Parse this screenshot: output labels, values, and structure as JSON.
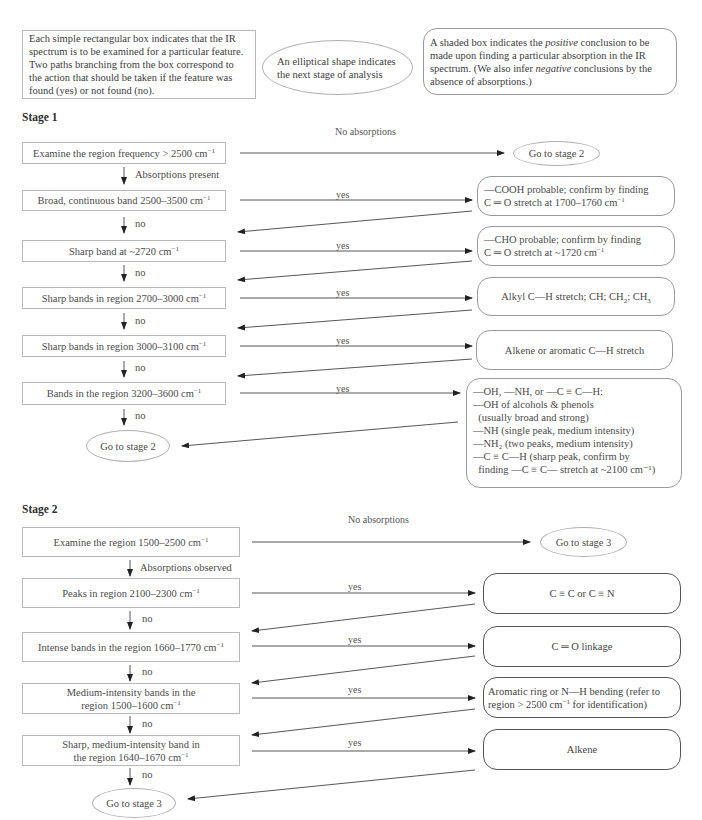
{
  "legend": {
    "rect_text": "Each simple rectangular box indicates that the IR spectrum is to be examined for a particular feature.  Two paths branching from the box correspond to the action that should be taken if the feature was found (yes) or not found (no).",
    "ellipse_text": "An elliptical shape indicates the next stage of analysis",
    "shaded_pre": "A shaded box indicates the ",
    "shaded_positive": "positive",
    "shaded_mid": " conclusion to be made upon finding a particular absorption in the IR spectrum.  (We also infer ",
    "shaded_negative": "negative",
    "shaded_post": " conclusions by the absence of absorptions.)"
  },
  "stage1": {
    "title": "Stage 1",
    "no_abs_label": "No absorptions",
    "abs_present_label": "Absorptions present",
    "yes_label": "yes",
    "no_label": "no",
    "goto": "Go to stage 2",
    "checks": [
      {
        "text": "Examine the region frequency > 2500 cm",
        "sup": "−1"
      },
      {
        "text": "Broad, continuous band 2500–3500 cm",
        "sup": "−1"
      },
      {
        "text": "Sharp band at ~2720 cm",
        "sup": "−1"
      },
      {
        "text": "Sharp bands in region 2700–3000 cm",
        "sup": "−1"
      },
      {
        "text": "Sharp bands in region 3000–3100 cm",
        "sup": "−1"
      },
      {
        "text": "Bands in the region 3200–3600 cm",
        "sup": "−1"
      }
    ],
    "results": {
      "cooh_line1": "—COOH probable; confirm by finding",
      "cooh_line2": "C ═ O stretch at 1700–1760 cm",
      "cho_line1": "—CHO probable; confirm by finding",
      "cho_line2": "C ═ O stretch at ~1720 cm",
      "alkyl": "Alkyl C—H stretch; CH; CH",
      "alkyl_sub2": "2",
      "alkyl_mid": "; CH",
      "alkyl_sub3": "3",
      "alkene_ar": "Alkene or aromatic C—H stretch",
      "oh_lines": [
        "—OH, —NH, or —C ≡ C—H:",
        "—OH of alcohols & phenols",
        "  (usually broad and strong)",
        "—NH (single peak, medium intensity)",
        "—NH₂ (two peaks, medium intensity)",
        "—C ≡ C—H (sharp peak, confirm by",
        "  finding —C ≡ C— stretch at ~2100 cm⁻¹)"
      ],
      "sup": "−1"
    }
  },
  "stage2": {
    "title": "Stage 2",
    "no_abs_label": "No absorptions",
    "abs_observed_label": "Absorptions observed",
    "yes_label": "yes",
    "no_label": "no",
    "goto": "Go to stage 3",
    "checks": [
      {
        "line1": "Examine the region 1500–2500 cm",
        "sup": "−1",
        "line2": ""
      },
      {
        "line1": "Peaks in region 2100–2300 cm",
        "sup": "−1",
        "line2": ""
      },
      {
        "line1": "Intense bands in the region 1660–1770 cm",
        "sup": "−1",
        "line2": ""
      },
      {
        "line1": "Medium-intensity bands  in the",
        "line2": "region 1500–1600 cm",
        "sup": "−1"
      },
      {
        "line1": "Sharp, medium-intensity band in",
        "line2": "the region 1640–1670 cm",
        "sup": "−1"
      }
    ],
    "results": {
      "triple": "C ≡ C or C ≡ N",
      "carbonyl": "C ═ O linkage",
      "aromatic_line1": "Aromatic ring or N—H bending (refer to",
      "aromatic_line2a": "region > 2500 cm",
      "aromatic_line2b": " for identification)",
      "alkene": "Alkene",
      "sup": "−1"
    }
  }
}
